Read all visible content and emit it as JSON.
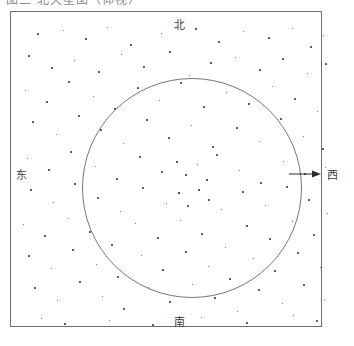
{
  "caption": {
    "text": "图三  北天星图（仰视）"
  },
  "chart": {
    "title": "星图",
    "frame": {
      "stroke": "#6f6f6f"
    },
    "horizon": {
      "label": "horizon-circle",
      "stroke": "#767676"
    },
    "directions": [
      {
        "key": "north",
        "label": "北"
      },
      {
        "key": "south",
        "label": "南"
      },
      {
        "key": "east",
        "label": "东"
      },
      {
        "key": "west",
        "label": "西"
      }
    ],
    "arrow": {
      "direction": "west",
      "color": "#2b2b2b"
    },
    "star_color": "#1b1b1b"
  },
  "chart_data": {
    "type": "scatter",
    "title": "",
    "xlabel": "",
    "ylabel": "",
    "xlim": [
      0,
      312
    ],
    "ylim": [
      0,
      316
    ],
    "grid": false,
    "legend": null,
    "annotations": [
      "北",
      "南",
      "东",
      "西"
    ],
    "overlays": [
      {
        "type": "rect",
        "x": 0,
        "y": 0,
        "w": 312,
        "h": 316
      },
      {
        "type": "circle",
        "cx": 181,
        "cy": 176,
        "r": 110
      },
      {
        "type": "arrow",
        "x1": 291,
        "y1": 176,
        "x2": 321,
        "y2": 176
      }
    ],
    "series": [
      {
        "name": "stars",
        "points": [
          [
            27,
            22,
            1.2
          ],
          [
            52,
            18,
            1.0
          ],
          [
            75,
            27,
            1.4
          ],
          [
            96,
            15,
            1.0
          ],
          [
            120,
            33,
            1.2
          ],
          [
            150,
            21,
            1.0
          ],
          [
            185,
            17,
            1.6
          ],
          [
            208,
            30,
            1.1
          ],
          [
            232,
            19,
            1.0
          ],
          [
            258,
            26,
            1.3
          ],
          [
            281,
            16,
            1.0
          ],
          [
            300,
            35,
            1.2
          ],
          [
            312,
            23,
            1.0
          ],
          [
            18,
            44,
            1.1
          ],
          [
            41,
            56,
            1.4
          ],
          [
            63,
            48,
            1.0
          ],
          [
            88,
            60,
            1.2
          ],
          [
            110,
            42,
            1.0
          ],
          [
            133,
            55,
            1.3
          ],
          [
            159,
            40,
            1.1
          ],
          [
            178,
            63,
            1.0
          ],
          [
            200,
            51,
            1.2
          ],
          [
            224,
            45,
            1.0
          ],
          [
            249,
            58,
            1.4
          ],
          [
            272,
            47,
            1.1
          ],
          [
            296,
            61,
            1.0
          ],
          [
            315,
            52,
            1.2
          ],
          [
            14,
            78,
            1.0
          ],
          [
            36,
            90,
            1.3
          ],
          [
            58,
            70,
            1.1
          ],
          [
            82,
            84,
            1.0
          ],
          [
            104,
            97,
            1.5
          ],
          [
            127,
            76,
            1.2
          ],
          [
            148,
            88,
            1.0
          ],
          [
            170,
            71,
            1.3
          ],
          [
            193,
            95,
            1.1
          ],
          [
            215,
            80,
            1.0
          ],
          [
            238,
            92,
            1.4
          ],
          [
            261,
            74,
            1.0
          ],
          [
            284,
            87,
            1.2
          ],
          [
            306,
            99,
            1.0
          ],
          [
            22,
            110,
            1.2
          ],
          [
            45,
            122,
            1.0
          ],
          [
            68,
            104,
            1.3
          ],
          [
            90,
            118,
            1.1
          ],
          [
            112,
            131,
            1.0
          ],
          [
            136,
            108,
            1.6
          ],
          [
            158,
            126,
            1.2
          ],
          [
            180,
            113,
            1.0
          ],
          [
            202,
            135,
            1.4
          ],
          [
            226,
            116,
            1.1
          ],
          [
            248,
            129,
            1.0
          ],
          [
            270,
            107,
            1.2
          ],
          [
            292,
            124,
            1.0
          ],
          [
            312,
            137,
            1.1
          ],
          [
            16,
            146,
            1.0
          ],
          [
            38,
            158,
            1.3
          ],
          [
            60,
            140,
            1.1
          ],
          [
            84,
            154,
            1.0
          ],
          [
            106,
            167,
            1.2
          ],
          [
            129,
            145,
            1.9
          ],
          [
            151,
            160,
            1.3
          ],
          [
            166,
            150,
            1.5
          ],
          [
            175,
            163,
            1.4
          ],
          [
            186,
            152,
            1.0
          ],
          [
            196,
            168,
            1.6
          ],
          [
            206,
            143,
            1.1
          ],
          [
            228,
            158,
            1.0
          ],
          [
            250,
            171,
            1.3
          ],
          [
            272,
            149,
            1.0
          ],
          [
            294,
            162,
            1.1
          ],
          [
            314,
            155,
            1.0
          ],
          [
            20,
            178,
            1.2
          ],
          [
            42,
            190,
            1.0
          ],
          [
            64,
            172,
            1.4
          ],
          [
            87,
            186,
            1.1
          ],
          [
            109,
            199,
            1.0
          ],
          [
            132,
            176,
            1.3
          ],
          [
            155,
            191,
            1.0
          ],
          [
            168,
            181,
            1.7
          ],
          [
            177,
            194,
            1.2
          ],
          [
            188,
            178,
            2.0
          ],
          [
            198,
            188,
            1.5
          ],
          [
            210,
            197,
            1.0
          ],
          [
            232,
            180,
            1.2
          ],
          [
            254,
            193,
            1.0
          ],
          [
            276,
            175,
            1.3
          ],
          [
            298,
            188,
            1.1
          ],
          [
            316,
            201,
            1.0
          ],
          [
            12,
            212,
            1.0
          ],
          [
            34,
            224,
            1.2
          ],
          [
            57,
            206,
            1.0
          ],
          [
            79,
            220,
            1.3
          ],
          [
            101,
            233,
            1.1
          ],
          [
            124,
            211,
            1.0
          ],
          [
            147,
            226,
            1.4
          ],
          [
            169,
            208,
            1.0
          ],
          [
            191,
            222,
            1.2
          ],
          [
            214,
            235,
            1.0
          ],
          [
            236,
            214,
            1.3
          ],
          [
            259,
            227,
            1.1
          ],
          [
            281,
            209,
            1.0
          ],
          [
            303,
            223,
            1.2
          ],
          [
            18,
            244,
            1.1
          ],
          [
            40,
            256,
            1.0
          ],
          [
            62,
            238,
            1.3
          ],
          [
            85,
            252,
            1.0
          ],
          [
            107,
            265,
            1.2
          ],
          [
            130,
            243,
            1.0
          ],
          [
            152,
            258,
            1.4
          ],
          [
            175,
            240,
            1.1
          ],
          [
            197,
            254,
            1.0
          ],
          [
            219,
            267,
            1.2
          ],
          [
            242,
            246,
            1.0
          ],
          [
            264,
            259,
            1.3
          ],
          [
            287,
            241,
            1.1
          ],
          [
            309,
            255,
            1.0
          ],
          [
            24,
            276,
            1.2
          ],
          [
            46,
            288,
            1.0
          ],
          [
            69,
            270,
            1.3
          ],
          [
            91,
            284,
            1.0
          ],
          [
            113,
            297,
            1.1
          ],
          [
            137,
            275,
            1.0
          ],
          [
            159,
            290,
            1.2
          ],
          [
            181,
            272,
            1.0
          ],
          [
            204,
            286,
            1.4
          ],
          [
            226,
            299,
            1.0
          ],
          [
            248,
            278,
            1.1
          ],
          [
            271,
            291,
            1.0
          ],
          [
            293,
            273,
            1.2
          ],
          [
            313,
            287,
            1.0
          ],
          [
            30,
            306,
            1.0
          ],
          [
            54,
            312,
            1.2
          ],
          [
            98,
            308,
            1.0
          ],
          [
            142,
            313,
            1.1
          ],
          [
            190,
            305,
            1.0
          ],
          [
            236,
            311,
            1.2
          ],
          [
            282,
            303,
            1.0
          ],
          [
            306,
            309,
            1.1
          ]
        ]
      }
    ]
  }
}
